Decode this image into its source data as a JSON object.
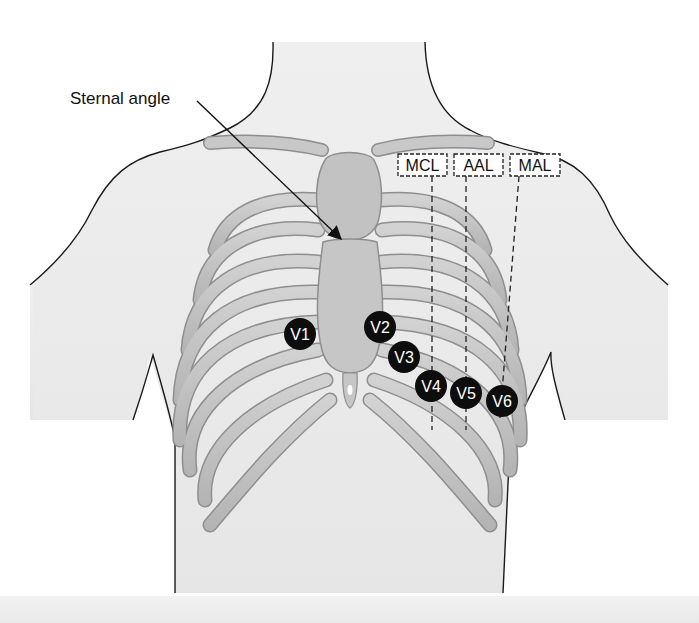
{
  "figure": {
    "annotation": {
      "label": "Sternal angle"
    },
    "reference_lines": [
      {
        "id": "mcl",
        "label": "MCL"
      },
      {
        "id": "aal",
        "label": "AAL"
      },
      {
        "id": "mal",
        "label": "MAL"
      }
    ],
    "leads": [
      {
        "id": "v1",
        "label": "V1",
        "x": 300,
        "y": 334
      },
      {
        "id": "v2",
        "label": "V2",
        "x": 380,
        "y": 327
      },
      {
        "id": "v3",
        "label": "V3",
        "x": 404,
        "y": 357
      },
      {
        "id": "v4",
        "label": "V4",
        "x": 431,
        "y": 386
      },
      {
        "id": "v5",
        "label": "V5",
        "x": 466,
        "y": 393
      },
      {
        "id": "v6",
        "label": "V6",
        "x": 502,
        "y": 401
      }
    ]
  },
  "colors": {
    "skin": "#ececec",
    "outline": "#1a1a1a",
    "bone": "#c4c4c4",
    "bone_edge": "#8e8e8e",
    "lead_fill": "#0d0d0d",
    "lead_text": "#ffffff"
  }
}
